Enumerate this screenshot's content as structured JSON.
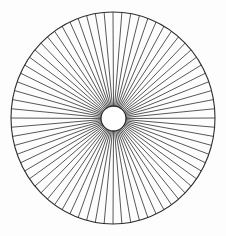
{
  "figure": {
    "background_color": "#fdfdfd",
    "line_color": "#3a3a3a",
    "rim_color": "#2e2e2e",
    "hub_fill_color": "#ffffff"
  },
  "chart_data": {
    "type": "line",
    "subtitle": "",
    "xlabel": "",
    "ylabel": "",
    "grid": false,
    "legend_position": "none",
    "canvas": {
      "width": 226,
      "height": 236
    },
    "outer_circle": {
      "center_x": 113,
      "center_y": 118,
      "radius_x": 102,
      "radius_y": 106,
      "stroke_width": 1.1
    },
    "inner_circle": {
      "center_x": 113.5,
      "center_y": 118.5,
      "radius_x": 12.5,
      "radius_y": 12.5,
      "stroke_width": 1.3
    },
    "spokes": {
      "count": 72,
      "angle_step_degrees": 5,
      "start_angle_degrees": 0,
      "stroke_width": 0.85,
      "inner_radius_fraction": 1.0,
      "outer_radius_fraction": 1.0
    },
    "categories": [],
    "values": [],
    "annotations": []
  }
}
